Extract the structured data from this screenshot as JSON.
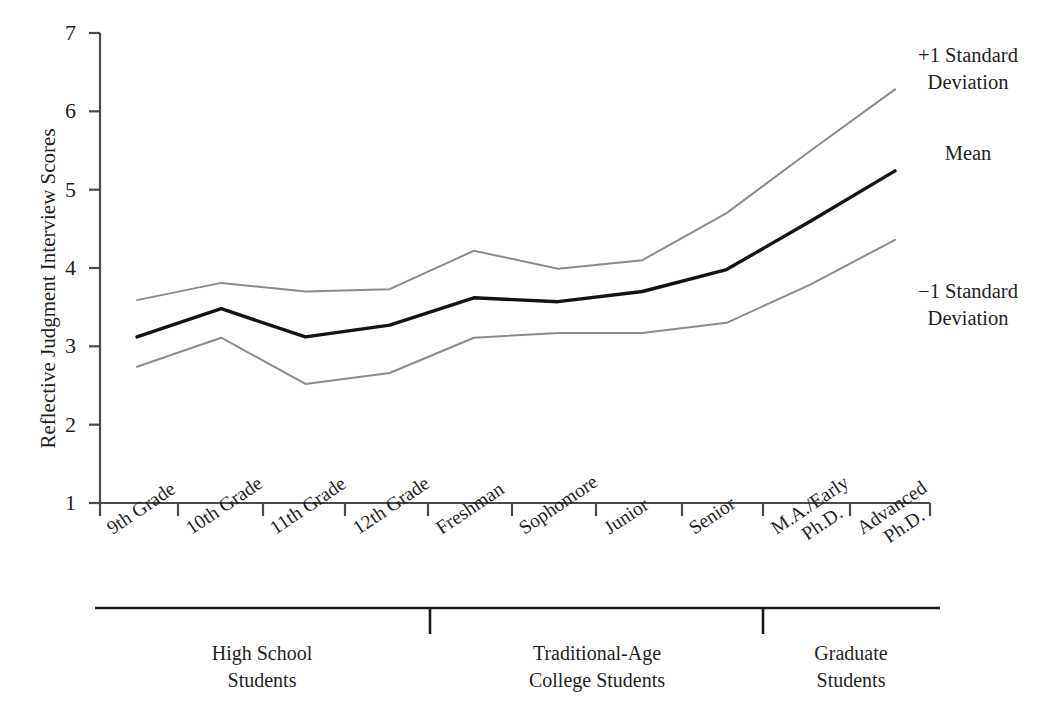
{
  "chart_data": {
    "type": "line",
    "title": "",
    "xlabel": "",
    "ylabel": "Reflective Judgment Interview Scores",
    "ylim": [
      1,
      7
    ],
    "yticks": [
      1,
      2,
      3,
      4,
      5,
      6,
      7
    ],
    "grid": false,
    "legend_position": "right",
    "categories": [
      "9th Grade",
      "10th Grade",
      "11th Grade",
      "12th Grade",
      "Freshman",
      "Sophomore",
      "Junior",
      "Senior",
      "M.A./Early Ph.D.",
      "Advanced Ph.D."
    ],
    "category_lines": [
      [
        "9th Grade"
      ],
      [
        "10th Grade"
      ],
      [
        "11th Grade"
      ],
      [
        "12th Grade"
      ],
      [
        "Freshman"
      ],
      [
        "Sophomore"
      ],
      [
        "Junior"
      ],
      [
        "Senior"
      ],
      [
        "M.A./Early",
        "Ph.D."
      ],
      [
        "Advanced",
        "Ph.D."
      ]
    ],
    "series": [
      {
        "name": "+1 Standard Deviation",
        "label_lines": [
          "+1 Standard",
          "Deviation"
        ],
        "color": "#8c8c8c",
        "width": 2,
        "values": [
          3.59,
          3.81,
          3.7,
          3.73,
          4.22,
          3.99,
          4.1,
          4.7,
          5.5,
          6.28
        ]
      },
      {
        "name": "Mean",
        "label_lines": [
          "Mean"
        ],
        "color": "#141414",
        "width": 3.4,
        "values": [
          3.12,
          3.48,
          3.12,
          3.27,
          3.62,
          3.57,
          3.7,
          3.98,
          4.6,
          5.24
        ]
      },
      {
        "name": "-1 Standard Deviation",
        "label_lines": [
          "−1 Standard",
          "Deviation"
        ],
        "color": "#8c8c8c",
        "width": 2,
        "values": [
          2.74,
          3.11,
          2.52,
          2.66,
          3.11,
          3.17,
          3.17,
          3.3,
          3.79,
          4.36
        ]
      }
    ],
    "groups": [
      {
        "label_lines": [
          "High School",
          "Students"
        ],
        "categories": [
          "9th Grade",
          "10th Grade",
          "11th Grade",
          "12th Grade"
        ]
      },
      {
        "label_lines": [
          "Traditional-Age",
          "College Students"
        ],
        "categories": [
          "Freshman",
          "Sophomore",
          "Junior",
          "Senior"
        ]
      },
      {
        "label_lines": [
          "Graduate",
          "Students"
        ],
        "categories": [
          "M.A./Early Ph.D.",
          "Advanced Ph.D."
        ]
      }
    ],
    "axis_color": "#4a4a4a",
    "group_rule_color": "#1a1a1a"
  }
}
